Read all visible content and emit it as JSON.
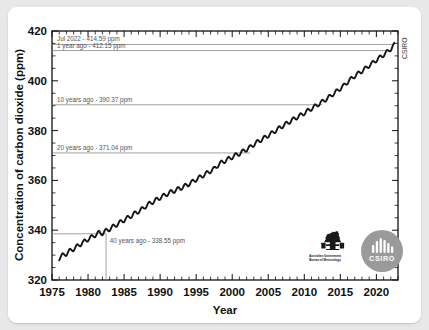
{
  "figure": {
    "background_color": "#ffffff",
    "page_background_color": "#e8e8e8",
    "side_label": "CSIRO"
  },
  "logos": [
    {
      "name": "australian-government-bom-logo",
      "line1": "Australian Government",
      "line2": "Bureau of Meteorology"
    },
    {
      "name": "csiro-logo",
      "label": "CSIRO",
      "color": "#9a9a9a"
    }
  ],
  "chart_data": {
    "type": "line",
    "title": "",
    "xlabel": "Year",
    "ylabel": "Concentration of carbon dioxide (ppm)",
    "xlim": [
      1975,
      2023
    ],
    "ylim": [
      320,
      420
    ],
    "xticks": [
      1975,
      1980,
      1985,
      1990,
      1995,
      2000,
      2005,
      2010,
      2015,
      2020
    ],
    "yticks": [
      320,
      340,
      360,
      380,
      400,
      420
    ],
    "grid": false,
    "legend_position": "none",
    "series": [
      {
        "name": "Atmospheric CO2 (Cape Grim)",
        "color": "#141414",
        "x": [
          1976.0,
          1976.5,
          1977.0,
          1977.5,
          1978.0,
          1978.5,
          1979.0,
          1979.5,
          1980.0,
          1980.5,
          1981.0,
          1981.5,
          1982.0,
          1982.5,
          1983.0,
          1983.5,
          1984.0,
          1984.5,
          1985.0,
          1985.5,
          1986.0,
          1986.5,
          1987.0,
          1987.5,
          1988.0,
          1988.5,
          1989.0,
          1989.5,
          1990.0,
          1990.5,
          1991.0,
          1991.5,
          1992.0,
          1992.5,
          1993.0,
          1993.5,
          1994.0,
          1994.5,
          1995.0,
          1995.5,
          1996.0,
          1996.5,
          1997.0,
          1997.5,
          1998.0,
          1998.5,
          1999.0,
          1999.5,
          2000.0,
          2000.5,
          2001.0,
          2001.5,
          2002.0,
          2002.5,
          2003.0,
          2003.5,
          2004.0,
          2004.5,
          2005.0,
          2005.5,
          2006.0,
          2006.5,
          2007.0,
          2007.5,
          2008.0,
          2008.5,
          2009.0,
          2009.5,
          2010.0,
          2010.5,
          2011.0,
          2011.5,
          2012.0,
          2012.5,
          2013.0,
          2013.5,
          2014.0,
          2014.5,
          2015.0,
          2015.5,
          2016.0,
          2016.5,
          2017.0,
          2017.5,
          2018.0,
          2018.5,
          2019.0,
          2019.5,
          2020.0,
          2020.5,
          2021.0,
          2021.5,
          2022.0,
          2022.5
        ],
        "y": [
          328.6,
          330.1,
          330.4,
          331.9,
          332.3,
          333.7,
          334.3,
          335.6,
          336.2,
          337.4,
          337.9,
          339.1,
          338.6,
          339.9,
          340.3,
          341.6,
          342.1,
          343.4,
          343.9,
          345.1,
          345.6,
          346.9,
          347.4,
          348.6,
          349.5,
          350.8,
          351.2,
          352.4,
          352.9,
          354.0,
          354.4,
          355.5,
          355.7,
          356.7,
          356.9,
          358.0,
          358.4,
          359.6,
          360.2,
          361.4,
          361.9,
          363.1,
          363.6,
          364.8,
          365.9,
          367.3,
          367.7,
          368.8,
          369.2,
          370.3,
          370.6,
          371.8,
          372.3,
          373.5,
          374.3,
          375.6,
          376.1,
          377.3,
          377.9,
          379.1,
          379.8,
          381.1,
          381.7,
          382.9,
          383.5,
          384.7,
          385.2,
          386.3,
          386.9,
          388.1,
          388.7,
          389.9,
          390.5,
          391.7,
          392.4,
          393.7,
          394.6,
          395.9,
          396.8,
          398.2,
          399.4,
          400.9,
          401.8,
          403.1,
          403.8,
          405.1,
          406.0,
          407.3,
          408.2,
          409.5,
          410.3,
          411.7,
          412.7,
          414.6
        ],
        "seasonal_amplitude_ppm": 0.7
      }
    ],
    "reference_lines": [
      {
        "label": "Jul 2022 - 414.59 ppm",
        "value": 414.59,
        "year": 2022.5
      },
      {
        "label": "1 year  ago - 412.15 ppm",
        "value": 412.15,
        "year": 2021.5
      },
      {
        "label": "10 years ago - 390.37 ppm",
        "value": 390.37,
        "year": 2012.5
      },
      {
        "label": "20 years ago - 371.04 ppm",
        "value": 371.04,
        "year": 2002.5
      },
      {
        "label": "40 years ago - 338.55 ppm",
        "value": 338.55,
        "year": 1982.5
      }
    ]
  }
}
